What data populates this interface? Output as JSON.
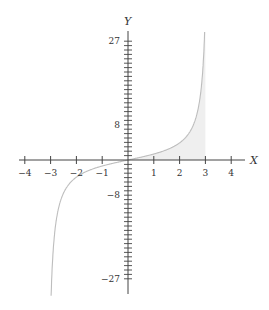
{
  "chart_data": {
    "type": "line",
    "title": "",
    "xlabel": "X",
    "ylabel": "Y",
    "xlim": [
      -4.4,
      4.6
    ],
    "ylim": [
      -30,
      30
    ],
    "grid": false,
    "legend": null,
    "x_ticks": [
      -4,
      -3,
      -2,
      -1,
      1,
      2,
      3,
      4
    ],
    "x_tick_labels": [
      "−4",
      "−3",
      "−2",
      "−1",
      "1",
      "2",
      "3",
      "4"
    ],
    "y_labeled_ticks": [
      27,
      8,
      -8,
      -27
    ],
    "y_tick_labels": [
      "27",
      "8",
      "−8",
      "−27"
    ],
    "y_minor_tick_step": 1,
    "series": [
      {
        "name": "curve",
        "description": "odd increasing function approx 2.5*tan(x/2), vertical asymptote near x=3",
        "x": [
          -2.97,
          -2.9,
          -2.8,
          -2.6,
          -2.4,
          -2.0,
          -1.5,
          -1.0,
          -0.5,
          0,
          0.5,
          1.0,
          1.5,
          2.0,
          2.4,
          2.6,
          2.8,
          2.9,
          2.97
        ],
        "y": [
          -30,
          -20.6,
          -14.1,
          -9.0,
          -6.4,
          -3.9,
          -2.4,
          -1.37,
          -0.63,
          0,
          0.63,
          1.37,
          2.4,
          3.9,
          6.4,
          9.0,
          14.1,
          20.6,
          30
        ],
        "color": "#bdbdbd"
      }
    ],
    "shaded_region": {
      "x_from": 0,
      "x_to": 3,
      "under": "curve",
      "color": "#f0f0f0"
    }
  }
}
